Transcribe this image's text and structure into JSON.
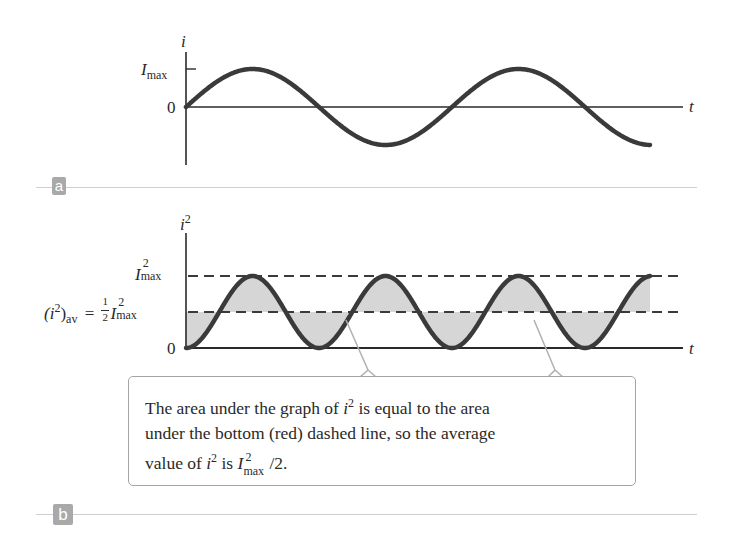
{
  "panel_a": {
    "badge": "a",
    "y_axis_label": "i",
    "x_axis_label": "t",
    "tick_imax_main": "I",
    "tick_imax_sub": "max",
    "tick_zero": "0"
  },
  "panel_b": {
    "badge": "b",
    "y_axis_label_main": "i",
    "y_axis_label_sup": "2",
    "x_axis_label": "t",
    "tick_imax2_main": "I",
    "tick_imax2_sup": "2",
    "tick_imax2_sub": "max",
    "tick_avg_lhs": "(i",
    "tick_avg_lhs_sup": "2",
    "tick_avg_lhs_close": ")",
    "tick_avg_lhs_sub": "av",
    "tick_avg_eq": "=",
    "tick_avg_frac_num": "1",
    "tick_avg_frac_den": "2",
    "tick_avg_rhs_main": "I",
    "tick_avg_rhs_sup": "2",
    "tick_avg_rhs_sub": "max",
    "tick_zero": "0"
  },
  "callout": {
    "line1_pre": "The area under the graph of ",
    "line1_var": "i",
    "line1_sup": "2",
    "line1_post": " is equal to the area",
    "line2": "under the bottom (red) dashed line, so the average",
    "line3_pre": "value of ",
    "line3_var": "i",
    "line3_sup": "2",
    "line3_mid": " is ",
    "line3_I": "I",
    "line3_I_sup": "2",
    "line3_I_sub": "max",
    "line3_post": "/2."
  },
  "colors": {
    "curve": "#3a3a3a",
    "axis": "#2a2a2a",
    "shade": "#d6d6d6",
    "callout_border": "#a5a5a5",
    "badge": "#a9a9a9",
    "divider": "#cfcfcf"
  },
  "chart_data": [
    {
      "type": "line",
      "title": "a",
      "xlabel": "t",
      "ylabel": "i",
      "series": [
        {
          "name": "i(t) = Imax sin(ωt)",
          "function": "sin",
          "periods_shown": 1.74
        }
      ],
      "y_ticks": [
        "0",
        "Imax"
      ],
      "grid": false
    },
    {
      "type": "area",
      "title": "b",
      "xlabel": "t",
      "ylabel": "i^2",
      "series": [
        {
          "name": "i^2(t) = Imax^2 sin^2(ωt)",
          "function": "sin^2",
          "periods_shown": 3.5
        }
      ],
      "reference_lines": [
        {
          "label": "Imax^2",
          "value": 1.0,
          "style": "dashed"
        },
        {
          "label": "(i^2)av = 1/2 Imax^2",
          "value": 0.5,
          "style": "dashed"
        }
      ],
      "shading": "between curve and average line",
      "y_ticks": [
        "0",
        "1/2 Imax^2",
        "Imax^2"
      ],
      "grid": false
    }
  ]
}
